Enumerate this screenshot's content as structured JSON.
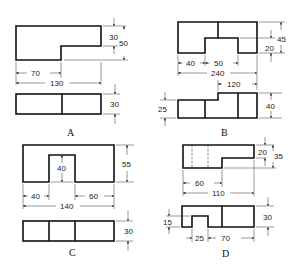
{
  "figures": [
    {
      "label": "A",
      "top_view_dims": {
        "notch_width": "70",
        "overall_width": "130",
        "step_height": "30",
        "overall_height": "50"
      },
      "front_view_dims": {
        "height": "30"
      }
    },
    {
      "label": "B",
      "top_view_dims": {
        "left_offset": "40",
        "notch_width": "50",
        "overall_width": "240",
        "total_height": "45",
        "notch_depth": "20"
      },
      "front_view_dims": {
        "right_width": "120",
        "left_height": "25",
        "overall_height": "40"
      }
    },
    {
      "label": "C",
      "top_view_dims": {
        "left_offset": "40",
        "notch_depth": "40",
        "right_offset": "60",
        "overall_width": "140",
        "overall_height": "55"
      },
      "front_view_dims": {
        "height": "30"
      }
    },
    {
      "label": "D",
      "top_view_dims": {
        "step_height": "20",
        "overall_height": "35",
        "left_width": "60",
        "overall_width": "110"
      },
      "front_view_dims": {
        "notch_height": "15",
        "notch_width": "25",
        "right_width": "70",
        "overall_height": "30"
      }
    }
  ]
}
